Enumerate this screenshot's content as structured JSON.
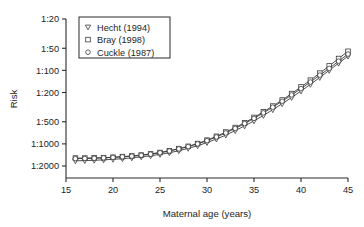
{
  "chart_data": {
    "type": "line",
    "title": "",
    "xlabel": "Maternal age (years)",
    "ylabel": "Risk",
    "xlim": [
      15,
      45
    ],
    "xticks": [
      15,
      20,
      25,
      30,
      35,
      40,
      45
    ],
    "xticklabels": [
      "15",
      "20",
      "25",
      "30",
      "35",
      "40",
      "45"
    ],
    "yticklabels": [
      "1:20",
      "1:50",
      "1:100",
      "1:200",
      "1:500",
      "1:1000",
      "1:2000"
    ],
    "ytickvalues": [
      20,
      50,
      100,
      200,
      500,
      1000,
      2000
    ],
    "yscale": "log-reciprocal-descending",
    "ylim_denominator": [
      20,
      2000
    ],
    "grid": false,
    "legend_position": "top-left",
    "x": [
      16,
      17,
      18,
      19,
      20,
      21,
      22,
      23,
      24,
      25,
      26,
      27,
      28,
      29,
      30,
      31,
      32,
      33,
      34,
      35,
      36,
      37,
      38,
      39,
      40,
      41,
      42,
      43,
      44,
      45
    ],
    "series": [
      {
        "name": "Hecht (1994)",
        "marker": "triangle-down",
        "denominators": [
          1700,
          1690,
          1670,
          1650,
          1620,
          1590,
          1550,
          1500,
          1450,
          1390,
          1320,
          1240,
          1150,
          1060,
          960,
          860,
          760,
          660,
          570,
          487,
          410,
          343,
          284,
          234,
          191,
          155,
          125,
          100,
          80,
          64
        ]
      },
      {
        "name": "Bray (1998)",
        "marker": "square",
        "denominators": [
          1560,
          1560,
          1550,
          1540,
          1520,
          1490,
          1460,
          1420,
          1370,
          1310,
          1240,
          1160,
          1080,
          990,
          890,
          790,
          690,
          600,
          515,
          437,
          367,
          306,
          253,
          207,
          168,
          136,
          109,
          87,
          69,
          55
        ]
      },
      {
        "name": "Cuckle (1987)",
        "marker": "circle",
        "denominators": [
          1590,
          1580,
          1570,
          1550,
          1530,
          1500,
          1470,
          1430,
          1380,
          1320,
          1250,
          1170,
          1090,
          1000,
          905,
          805,
          710,
          617,
          530,
          450,
          379,
          317,
          263,
          216,
          177,
          144,
          116,
          94,
          75,
          60
        ]
      }
    ],
    "legend_entries": [
      {
        "label": "Hecht (1994)",
        "marker": "triangle-down"
      },
      {
        "label": "Bray (1998)",
        "marker": "square"
      },
      {
        "label": "Cuckle (1987)",
        "marker": "circle"
      }
    ],
    "colors": {
      "axis": "#2b2b2b",
      "line": "#3a3a3a",
      "marker_fill": "#ffffff",
      "background": "#ffffff"
    }
  }
}
